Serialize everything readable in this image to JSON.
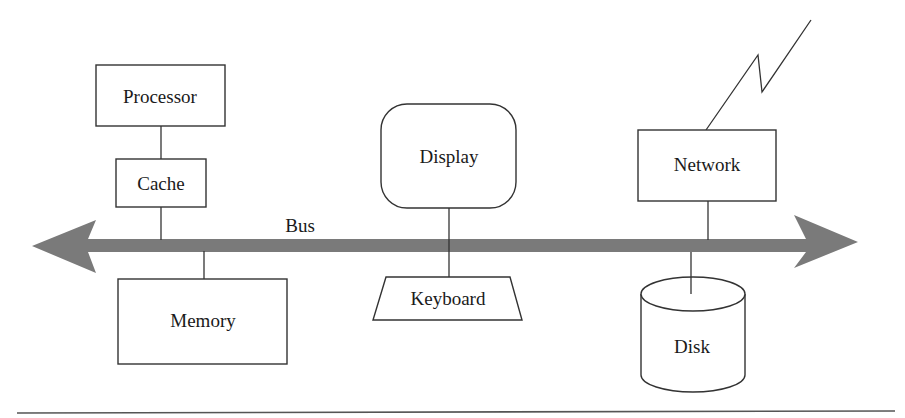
{
  "diagram": {
    "bus": {
      "label": "Bus",
      "color": "#7a7a7a"
    },
    "components": {
      "processor": {
        "label": "Processor"
      },
      "cache": {
        "label": "Cache"
      },
      "memory": {
        "label": "Memory"
      },
      "display": {
        "label": "Display"
      },
      "keyboard": {
        "label": "Keyboard"
      },
      "network": {
        "label": "Network"
      },
      "disk": {
        "label": "Disk"
      }
    },
    "icons": {
      "network_signal": "lightning-bolt-icon"
    }
  }
}
